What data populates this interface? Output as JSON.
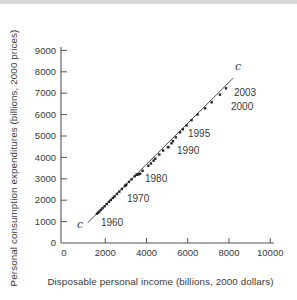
{
  "figure": {
    "top_band_color": "#d9d9d9",
    "background": "#ffffff",
    "text_color": "#3a3a3a",
    "axis_color": "#555555"
  },
  "chart_data": {
    "type": "scatter",
    "title": "",
    "xlabel": "Disposable personal income (billions, 2000 dollars)",
    "ylabel": "Personal consumption expenditures (billions, 2000 prices)",
    "xlim": [
      0,
      10000
    ],
    "ylim": [
      0,
      9000
    ],
    "x_ticks": [
      0,
      2000,
      4000,
      6000,
      8000,
      10000
    ],
    "y_ticks": [
      0,
      1000,
      2000,
      3000,
      4000,
      5000,
      6000,
      7000,
      8000,
      9000
    ],
    "grid": false,
    "legend": "none",
    "marker_color": "#262626",
    "series": [
      {
        "name": "consumption-vs-income",
        "marker": "square",
        "points": [
          {
            "year": 1959,
            "income": 1600,
            "consumption": 1370
          },
          {
            "year": 1960,
            "income": 1655,
            "consumption": 1420
          },
          {
            "year": 1961,
            "income": 1705,
            "consumption": 1465
          },
          {
            "year": 1962,
            "income": 1785,
            "consumption": 1545
          },
          {
            "year": 1963,
            "income": 1865,
            "consumption": 1620
          },
          {
            "year": 1964,
            "income": 1965,
            "consumption": 1715
          },
          {
            "year": 1965,
            "income": 2070,
            "consumption": 1820
          },
          {
            "year": 1966,
            "income": 2180,
            "consumption": 1925
          },
          {
            "year": 1967,
            "income": 2270,
            "consumption": 2010
          },
          {
            "year": 1968,
            "income": 2370,
            "consumption": 2105
          },
          {
            "year": 1969,
            "income": 2450,
            "consumption": 2180
          },
          {
            "year": 1970,
            "income": 2570,
            "consumption": 2295
          },
          {
            "year": 1971,
            "income": 2680,
            "consumption": 2400
          },
          {
            "year": 1972,
            "income": 2805,
            "consumption": 2525
          },
          {
            "year": 1973,
            "income": 2980,
            "consumption": 2690
          },
          {
            "year": 1974,
            "income": 2955,
            "consumption": 2660
          },
          {
            "year": 1975,
            "income": 3020,
            "consumption": 2725
          },
          {
            "year": 1976,
            "income": 3150,
            "consumption": 2855
          },
          {
            "year": 1977,
            "income": 3275,
            "consumption": 2975
          },
          {
            "year": 1978,
            "income": 3430,
            "consumption": 3120
          },
          {
            "year": 1979,
            "income": 3520,
            "consumption": 3200
          },
          {
            "year": 1980,
            "income": 3555,
            "consumption": 3185
          },
          {
            "year": 1981,
            "income": 3640,
            "consumption": 3215
          },
          {
            "year": 1982,
            "income": 3690,
            "consumption": 3240
          },
          {
            "year": 1983,
            "income": 3810,
            "consumption": 3375
          },
          {
            "year": 1984,
            "income": 4090,
            "consumption": 3610
          },
          {
            "year": 1985,
            "income": 4215,
            "consumption": 3715
          },
          {
            "year": 1986,
            "income": 4345,
            "consumption": 3850
          },
          {
            "year": 1987,
            "income": 4425,
            "consumption": 3940
          },
          {
            "year": 1988,
            "income": 4620,
            "consumption": 4135
          },
          {
            "year": 1989,
            "income": 4805,
            "consumption": 4320
          },
          {
            "year": 1990,
            "income": 5040,
            "consumption": 4480
          },
          {
            "year": 1991,
            "income": 5065,
            "consumption": 4480
          },
          {
            "year": 1992,
            "income": 5215,
            "consumption": 4660
          },
          {
            "year": 1993,
            "income": 5285,
            "consumption": 4765
          },
          {
            "year": 1994,
            "income": 5425,
            "consumption": 4935
          },
          {
            "year": 1995,
            "income": 5625,
            "consumption": 5170
          },
          {
            "year": 1996,
            "income": 5765,
            "consumption": 5315
          },
          {
            "year": 1997,
            "income": 5945,
            "consumption": 5495
          },
          {
            "year": 1998,
            "income": 6185,
            "consumption": 5740
          },
          {
            "year": 1999,
            "income": 6480,
            "consumption": 6005
          },
          {
            "year": 2000,
            "income": 6840,
            "consumption": 6295
          },
          {
            "year": 2001,
            "income": 7160,
            "consumption": 6575
          },
          {
            "year": 2002,
            "income": 7560,
            "consumption": 6930
          },
          {
            "year": 2003,
            "income": 7855,
            "consumption": 7230
          }
        ]
      }
    ],
    "fit_line": {
      "label": "c",
      "color": "#4a4a4a",
      "from": [
        1150,
        950
      ],
      "to": [
        8200,
        7700
      ],
      "labels": [
        {
          "text": "c",
          "anchor": [
            630,
            700
          ]
        },
        {
          "text": "c",
          "anchor": [
            8290,
            8085
          ]
        }
      ]
    },
    "annotations": [
      {
        "text": "1960",
        "anchor": [
          1790,
          795
        ]
      },
      {
        "text": "1970",
        "anchor": [
          3055,
          1915
        ]
      },
      {
        "text": "1980",
        "anchor": [
          3925,
          2850
        ]
      },
      {
        "text": "1990",
        "anchor": [
          5480,
          4160
        ]
      },
      {
        "text": "1995",
        "anchor": [
          6010,
          4955
        ]
      },
      {
        "text": "2000",
        "anchor": [
          8095,
          6215
        ]
      },
      {
        "text": "2003",
        "anchor": [
          8240,
          6870
        ]
      }
    ]
  }
}
